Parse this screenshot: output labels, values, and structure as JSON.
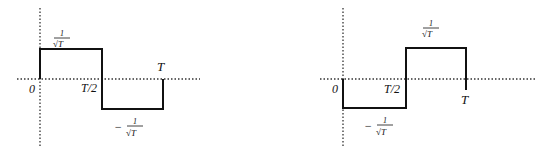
{
  "diagrams": [
    {
      "name": "left-waveform",
      "description": "Square wave: +1/sqrt(T) on [0,T/2], -1/sqrt(T) on [T/2,T]",
      "labels": {
        "origin": "0",
        "half_period": "T/2",
        "period": "T",
        "pos_num": "1",
        "pos_den": "√T",
        "neg_sign": "−",
        "neg_num": "1",
        "neg_den": "√T"
      }
    },
    {
      "name": "right-waveform",
      "description": "Square wave: -1/sqrt(T) on [0,T/2], +1/sqrt(T) on [T/2,T]",
      "labels": {
        "origin": "0",
        "half_period": "T/2",
        "period": "T",
        "pos_num": "1",
        "pos_den": "√T",
        "neg_sign": "−",
        "neg_num": "1",
        "neg_den": "√T"
      }
    }
  ],
  "colors": {
    "line": "#111111",
    "axis": "#333333",
    "background": "#ffffff"
  }
}
